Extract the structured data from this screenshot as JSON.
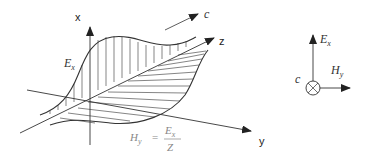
{
  "diagram": {
    "axes": {
      "x_label": "x",
      "y_label": "y",
      "z_label": "z"
    },
    "propagation": {
      "label": "c"
    },
    "electric_field": {
      "symbol": "E",
      "subscript": "x"
    },
    "magnetic_field": {
      "symbol": "H",
      "subscript": "y"
    },
    "formula": {
      "lhs_symbol": "H",
      "lhs_subscript": "y",
      "equals": "=",
      "numerator_symbol": "E",
      "numerator_subscript": "x",
      "denominator": "Z"
    },
    "cross_section": {
      "e_symbol": "E",
      "e_subscript": "x",
      "h_symbol": "H",
      "h_subscript": "y",
      "c_label": "c"
    },
    "colors": {
      "line": "#333333",
      "formula_text": "#888888",
      "arrow_fill": "#222222"
    }
  }
}
